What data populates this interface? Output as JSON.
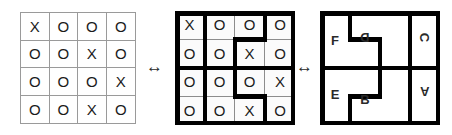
{
  "figure": {
    "colors": {
      "background": "#ffffff",
      "thin_line": "#9a9a9a",
      "heavy_wall": "#000000",
      "symbol": "#1b1b1b",
      "cell_fill": "#fbfbfb"
    }
  },
  "panels": {
    "plain_grid": {
      "name": "plain symbol grid",
      "rows": 4,
      "cols": 4,
      "cells": [
        [
          "X",
          "O",
          "O",
          "O"
        ],
        [
          "O",
          "O",
          "X",
          "O"
        ],
        [
          "O",
          "O",
          "O",
          "X"
        ],
        [
          "O",
          "O",
          "X",
          "O"
        ]
      ]
    },
    "walled_grid": {
      "name": "grid with region walls",
      "rows": 4,
      "cols": 4,
      "cells": [
        [
          "X",
          "O",
          "O",
          "O"
        ],
        [
          "O",
          "O",
          "X",
          "O"
        ],
        [
          "O",
          "O",
          "O",
          "X"
        ],
        [
          "O",
          "O",
          "X",
          "O"
        ]
      ]
    },
    "lettered_grid": {
      "name": "region labels rotated 180 degrees",
      "rows": 4,
      "cols": 4,
      "labels": [
        {
          "text": "F",
          "rotation": 0
        },
        {
          "text": "D",
          "rotation": 180
        },
        {
          "text": "C",
          "rotation": 90
        },
        {
          "text": "E",
          "rotation": 0
        },
        {
          "text": "B",
          "rotation": 0
        },
        {
          "text": "A",
          "rotation": 180
        }
      ]
    }
  },
  "connectors": {
    "arrow_1": "↔",
    "arrow_2": "↔"
  }
}
